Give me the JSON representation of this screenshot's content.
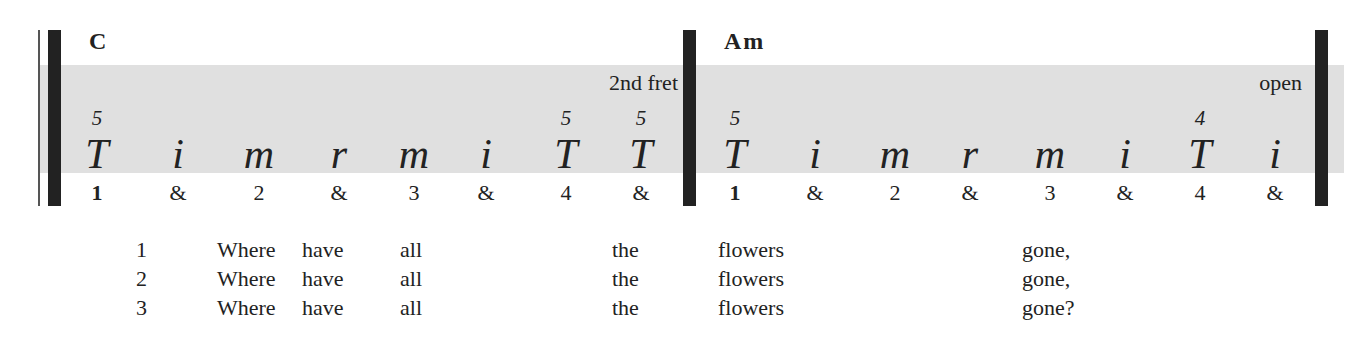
{
  "measures": [
    {
      "chord": "C",
      "position": "2nd fret",
      "cols": [
        {
          "x": 97,
          "fret": "5",
          "finger": "T",
          "beat": "1",
          "strong": true
        },
        {
          "x": 178,
          "fret": "",
          "finger": "i",
          "beat": "&"
        },
        {
          "x": 259,
          "fret": "",
          "finger": "m",
          "beat": "2"
        },
        {
          "x": 339,
          "fret": "",
          "finger": "r",
          "beat": "&"
        },
        {
          "x": 414,
          "fret": "",
          "finger": "m",
          "beat": "3"
        },
        {
          "x": 486,
          "fret": "",
          "finger": "i",
          "beat": "&"
        },
        {
          "x": 566,
          "fret": "5",
          "finger": "T",
          "beat": "4"
        },
        {
          "x": 641,
          "fret": "5",
          "finger": "T",
          "beat": "&"
        }
      ]
    },
    {
      "chord": "Am",
      "position": "open",
      "cols": [
        {
          "x": 735,
          "fret": "5",
          "finger": "T",
          "beat": "1",
          "strong": true
        },
        {
          "x": 815,
          "fret": "",
          "finger": "i",
          "beat": "&"
        },
        {
          "x": 895,
          "fret": "",
          "finger": "m",
          "beat": "2"
        },
        {
          "x": 970,
          "fret": "",
          "finger": "r",
          "beat": "&"
        },
        {
          "x": 1050,
          "fret": "",
          "finger": "m",
          "beat": "3"
        },
        {
          "x": 1125,
          "fret": "",
          "finger": "i",
          "beat": "&"
        },
        {
          "x": 1200,
          "fret": "4",
          "finger": "T",
          "beat": "4"
        },
        {
          "x": 1275,
          "fret": "",
          "finger": "i",
          "beat": "&"
        }
      ]
    }
  ],
  "lyrics": [
    {
      "verse": "1",
      "words": [
        "Where",
        "have",
        "all",
        "the",
        "flowers",
        "gone,"
      ]
    },
    {
      "verse": "2",
      "words": [
        "Where",
        "have",
        "all",
        "the",
        "flowers",
        "gone,"
      ]
    },
    {
      "verse": "3",
      "words": [
        "Where",
        "have",
        "all",
        "the",
        "flowers",
        "gone?"
      ]
    }
  ],
  "colors": {
    "band": "#e0e0e0",
    "bar": "#222222",
    "text": "#222222"
  }
}
